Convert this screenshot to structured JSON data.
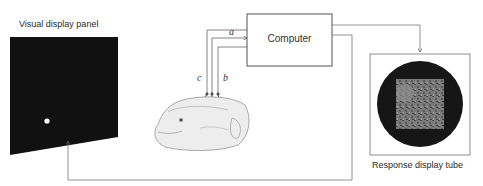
{
  "diagram": {
    "type": "block-diagram",
    "nodes": {
      "visual_panel": {
        "label": "Visual display panel",
        "fill": "#111111",
        "stimulus": "white-dot"
      },
      "computer": {
        "label": "Computer"
      },
      "response_tube": {
        "label": "Response display tube",
        "screen_fill": "#161616",
        "image_fill": "#7a7a7a"
      },
      "monkey": {
        "label": ""
      }
    },
    "wire_labels": {
      "a": "a",
      "b": "b",
      "c": "c"
    },
    "edges": [
      {
        "from": "monkey",
        "to": "computer",
        "label": "a"
      },
      {
        "from": "monkey",
        "to": "computer",
        "label": "b"
      },
      {
        "from": "monkey",
        "to": "computer",
        "label": "c"
      },
      {
        "from": "computer",
        "to": "response_tube",
        "label": ""
      },
      {
        "from": "computer",
        "to": "visual_panel",
        "label": ""
      }
    ]
  }
}
